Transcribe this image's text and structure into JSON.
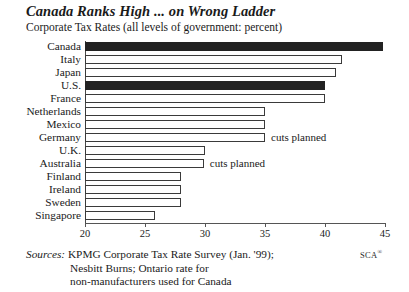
{
  "chart_data": {
    "type": "bar",
    "orientation": "horizontal",
    "title": "Canada Ranks High ... on Wrong Ladder",
    "subtitle": "Corporate Tax Rates (all levels of government: percent)",
    "xlabel": "",
    "ylabel": "",
    "xlim": [
      20,
      45
    ],
    "xticks": [
      20,
      25,
      30,
      35,
      40,
      45
    ],
    "xtick_labels": [
      "20",
      "25",
      "30",
      "35",
      "40",
      "45"
    ],
    "grid": false,
    "legend": "none",
    "categories": [
      "Canada",
      "Italy",
      "Japan",
      "U.S.",
      "France",
      "Netherlands",
      "Mexico",
      "Germany",
      "U.K.",
      "Australia",
      "Finland",
      "Ireland",
      "Sweden",
      "Singapore"
    ],
    "values": [
      44.8,
      41.4,
      40.9,
      40.0,
      40.0,
      35.0,
      35.0,
      35.0,
      30.0,
      29.9,
      28.0,
      28.0,
      28.0,
      25.8
    ],
    "highlighted": [
      "Canada",
      "U.S."
    ],
    "annotations": [
      {
        "category": "Germany",
        "text": "cuts planned"
      },
      {
        "category": "Australia",
        "text": "cuts planned"
      }
    ]
  },
  "sources": {
    "label": "Sources:",
    "line1": "KPMG Corporate Tax Rate Survey (Jan. '99);",
    "line2": "Nesbitt Burns; Ontario rate for",
    "line3": "non-manufacturers used for Canada"
  },
  "credit": {
    "text": "SCA",
    "mark": "®"
  },
  "colors": {
    "bar_fill_highlight": "#222222",
    "bar_fill_default": "#ffffff",
    "bar_outline": "#3a3a3a",
    "axis": "#555555",
    "text": "#1a1a1a"
  }
}
